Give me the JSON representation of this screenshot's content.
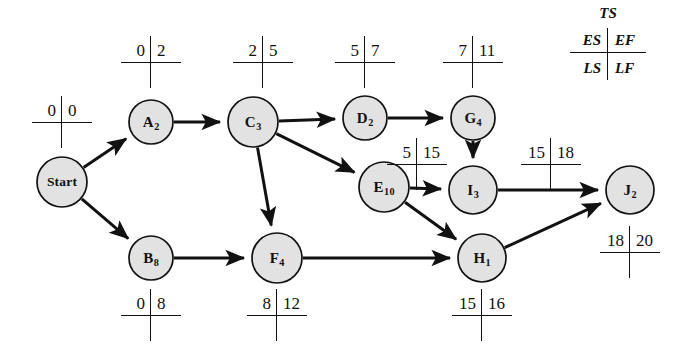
{
  "diagram": {
    "type": "project-network-aon",
    "title": "",
    "legend": {
      "ts_label": "TS",
      "es_label": "ES",
      "ef_label": "EF",
      "ls_label": "LS",
      "lf_label": "LF"
    },
    "node_fill_color": "#e2e2e2",
    "node_stroke_color": "#111111",
    "nodes": [
      {
        "id": "Start",
        "name": "Start",
        "duration": "",
        "display": "Start",
        "cx": 62,
        "cy": 182,
        "r": 25,
        "label_size": "small",
        "marker": {
          "left": "0",
          "right": "0",
          "cx": 62,
          "cy": 122
        }
      },
      {
        "id": "A",
        "name": "A",
        "duration": "2",
        "display": "A2",
        "cx": 151,
        "cy": 122,
        "r": 22,
        "label_size": "normal",
        "marker": {
          "left": "0",
          "right": "2",
          "cx": 151,
          "cy": 62
        }
      },
      {
        "id": "B",
        "name": "B",
        "duration": "8",
        "display": "B8",
        "cx": 151,
        "cy": 258,
        "r": 22,
        "label_size": "normal",
        "marker": {
          "left": "0",
          "right": "8",
          "cx": 151,
          "cy": 315
        }
      },
      {
        "id": "C",
        "name": "C",
        "duration": "3",
        "display": "C3",
        "cx": 253,
        "cy": 122,
        "r": 25,
        "label_size": "normal",
        "marker": {
          "left": "2",
          "right": "5",
          "cx": 263,
          "cy": 62
        }
      },
      {
        "id": "D",
        "name": "D",
        "duration": "2",
        "display": "D2",
        "cx": 365,
        "cy": 118,
        "r": 22,
        "label_size": "normal",
        "marker": {
          "left": "5",
          "right": "7",
          "cx": 365,
          "cy": 62
        }
      },
      {
        "id": "E",
        "name": "E",
        "duration": "10",
        "display": "E10",
        "cx": 384,
        "cy": 187,
        "r": 25,
        "label_size": "normal",
        "marker": {
          "left": "5",
          "right": "15",
          "cx": 417,
          "cy": 164
        }
      },
      {
        "id": "F",
        "name": "F",
        "duration": "4",
        "display": "F4",
        "cx": 277,
        "cy": 258,
        "r": 25,
        "label_size": "normal",
        "marker": {
          "left": "8",
          "right": "12",
          "cx": 277,
          "cy": 315
        }
      },
      {
        "id": "G",
        "name": "G",
        "duration": "4",
        "display": "G4",
        "cx": 473,
        "cy": 118,
        "r": 22,
        "label_size": "normal",
        "marker": {
          "left": "7",
          "right": "11",
          "cx": 473,
          "cy": 62
        }
      },
      {
        "id": "I",
        "name": "I",
        "duration": "3",
        "display": "I3",
        "cx": 473,
        "cy": 190,
        "r": 24,
        "label_size": "normal",
        "marker": {
          "left": "15",
          "right": "18",
          "cx": 551,
          "cy": 164
        }
      },
      {
        "id": "H",
        "name": "H",
        "duration": "1",
        "display": "H1",
        "cx": 482,
        "cy": 258,
        "r": 24,
        "label_size": "normal",
        "marker": {
          "left": "15",
          "right": "16",
          "cx": 482,
          "cy": 315
        }
      },
      {
        "id": "J",
        "name": "J",
        "duration": "2",
        "display": "J2",
        "cx": 630,
        "cy": 190,
        "r": 24,
        "label_size": "normal",
        "marker": {
          "left": "18",
          "right": "20",
          "cx": 630,
          "cy": 252
        }
      }
    ],
    "edges": [
      {
        "from": "Start",
        "to": "A"
      },
      {
        "from": "Start",
        "to": "B"
      },
      {
        "from": "A",
        "to": "C"
      },
      {
        "from": "C",
        "to": "D"
      },
      {
        "from": "C",
        "to": "E"
      },
      {
        "from": "C",
        "to": "F"
      },
      {
        "from": "B",
        "to": "F"
      },
      {
        "from": "D",
        "to": "G"
      },
      {
        "from": "G",
        "to": "I"
      },
      {
        "from": "E",
        "to": "I"
      },
      {
        "from": "E",
        "to": "H"
      },
      {
        "from": "F",
        "to": "H"
      },
      {
        "from": "I",
        "to": "J"
      },
      {
        "from": "H",
        "to": "J"
      }
    ]
  }
}
